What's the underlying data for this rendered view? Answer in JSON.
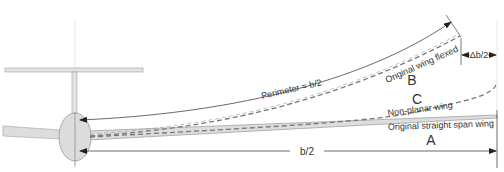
{
  "diagram": {
    "labels": {
      "perimeter": "Perimeter = b/2",
      "flexed": "Original wing flexed",
      "nonplanar": "Non-planar wing",
      "straight": "Original straight span wing",
      "half_span": "b/2",
      "delta": "Δb/2",
      "A": "A",
      "B": "B",
      "C": "C"
    },
    "colors": {
      "line": "#333333",
      "dashed": "#777777",
      "fill": "#d9d9d9",
      "structure_stroke": "#999999"
    }
  }
}
